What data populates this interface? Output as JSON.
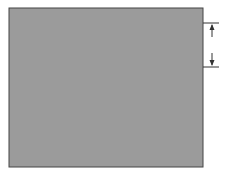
{
  "diagram": {
    "title": "",
    "colors": {
      "background": "#ffffff",
      "outer_fill": "#9b9b9b",
      "inner_fill": "#d4d4d4",
      "outline": "#222222",
      "dimension": "#333333"
    },
    "frame": {
      "x": 9,
      "y": 8,
      "width": 194,
      "height": 159
    },
    "top_zigzag": {
      "points": [
        [
          9,
          68
        ],
        [
          29,
          19
        ],
        [
          48,
          69
        ],
        [
          67,
          19
        ],
        [
          87,
          69
        ],
        [
          106,
          19
        ],
        [
          126,
          69
        ],
        [
          145,
          19
        ],
        [
          164,
          69
        ],
        [
          184,
          19
        ],
        [
          203,
          68
        ]
      ]
    },
    "bottom_zigzag": {
      "points": [
        [
          9,
          133
        ],
        [
          19,
          108
        ],
        [
          39,
          157
        ],
        [
          58,
          108
        ],
        [
          78,
          157
        ],
        [
          97,
          108
        ],
        [
          116,
          157
        ],
        [
          136,
          108
        ],
        [
          155,
          157
        ],
        [
          174,
          108
        ],
        [
          194,
          157
        ],
        [
          203,
          134
        ]
      ]
    },
    "dimension": {
      "label": "H",
      "x": 212,
      "y_top": 23,
      "y_bottom": 67,
      "tick_x1": 203,
      "tick_x2": 219
    }
  }
}
